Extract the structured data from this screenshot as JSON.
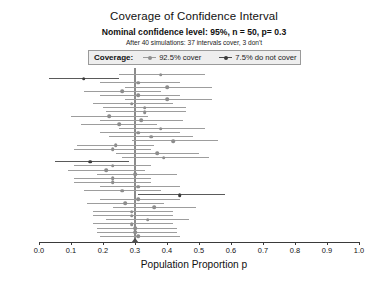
{
  "title": "Coverage of Confidence Interval",
  "subtitle": "Nominal confidence level: 95%, n = 50, p= 0.3",
  "subsubtitle": "After 40 simulations: 37 intervals cover, 3 don't",
  "legend": {
    "title": "Coverage:",
    "entries": [
      {
        "label": "92.5% cover",
        "marker": "cover",
        "color": "#9b9b9b"
      },
      {
        "label": "7.5% do not cover",
        "marker": "nocover",
        "color": "#4a4a4a"
      }
    ]
  },
  "chart_data": {
    "type": "line",
    "title": "Coverage of Confidence Interval",
    "subtitle": "Nominal confidence level: 95%, n = 50, p= 0.3",
    "annotation": "After 40 simulations: 37 intervals cover, 3 don't",
    "xlabel": "Population Proportion p",
    "ylabel": "",
    "xlim": [
      0.0,
      1.0
    ],
    "xticks": [
      0.0,
      0.1,
      0.2,
      0.3,
      0.4,
      0.5,
      0.6,
      0.7,
      0.8,
      0.9,
      1.0
    ],
    "xtick_labels": [
      "0.0",
      "0.1",
      "0.2",
      "0.3",
      "0.4",
      "0.5",
      "0.6",
      "0.7",
      "0.8",
      "0.9",
      "1.0"
    ],
    "grid": false,
    "legend_position": "top",
    "reference_line": {
      "value": 0.3,
      "label": "p = 0.3",
      "color": "#8c8c8c"
    },
    "n": 50,
    "nominal_level": 0.95,
    "n_simulations": 40,
    "n_cover": 37,
    "n_not_cover": 3,
    "pct_cover": "92.5%",
    "pct_not_cover": "7.5%",
    "series": [
      {
        "name": "92.5% cover",
        "color": "#9b9b9b"
      },
      {
        "name": "7.5% do not cover",
        "color": "#4a4a4a"
      }
    ],
    "intervals": [
      {
        "row": 1,
        "estimate": 0.38,
        "lower": 0.25,
        "upper": 0.52,
        "covers": true
      },
      {
        "row": 2,
        "estimate": 0.14,
        "lower": 0.03,
        "upper": 0.25,
        "covers": false
      },
      {
        "row": 3,
        "estimate": 0.31,
        "lower": 0.19,
        "upper": 0.44,
        "covers": true
      },
      {
        "row": 4,
        "estimate": 0.4,
        "lower": 0.27,
        "upper": 0.54,
        "covers": true
      },
      {
        "row": 5,
        "estimate": 0.26,
        "lower": 0.14,
        "upper": 0.38,
        "covers": true
      },
      {
        "row": 6,
        "estimate": 0.31,
        "lower": 0.19,
        "upper": 0.44,
        "covers": true
      },
      {
        "row": 7,
        "estimate": 0.4,
        "lower": 0.27,
        "upper": 0.54,
        "covers": true
      },
      {
        "row": 8,
        "estimate": 0.29,
        "lower": 0.17,
        "upper": 0.42,
        "covers": true
      },
      {
        "row": 9,
        "estimate": 0.33,
        "lower": 0.2,
        "upper": 0.46,
        "covers": true
      },
      {
        "row": 10,
        "estimate": 0.33,
        "lower": 0.21,
        "upper": 0.46,
        "covers": true
      },
      {
        "row": 11,
        "estimate": 0.22,
        "lower": 0.1,
        "upper": 0.34,
        "covers": true
      },
      {
        "row": 12,
        "estimate": 0.32,
        "lower": 0.19,
        "upper": 0.45,
        "covers": true
      },
      {
        "row": 13,
        "estimate": 0.25,
        "lower": 0.13,
        "upper": 0.37,
        "covers": true
      },
      {
        "row": 14,
        "estimate": 0.38,
        "lower": 0.25,
        "upper": 0.52,
        "covers": true
      },
      {
        "row": 15,
        "estimate": 0.31,
        "lower": 0.19,
        "upper": 0.44,
        "covers": true
      },
      {
        "row": 16,
        "estimate": 0.35,
        "lower": 0.22,
        "upper": 0.48,
        "covers": true
      },
      {
        "row": 17,
        "estimate": 0.42,
        "lower": 0.29,
        "upper": 0.56,
        "covers": true
      },
      {
        "row": 18,
        "estimate": 0.24,
        "lower": 0.12,
        "upper": 0.36,
        "covers": true
      },
      {
        "row": 19,
        "estimate": 0.23,
        "lower": 0.11,
        "upper": 0.35,
        "covers": true
      },
      {
        "row": 20,
        "estimate": 0.37,
        "lower": 0.24,
        "upper": 0.5,
        "covers": true
      },
      {
        "row": 21,
        "estimate": 0.39,
        "lower": 0.26,
        "upper": 0.53,
        "covers": true
      },
      {
        "row": 22,
        "estimate": 0.16,
        "lower": 0.05,
        "upper": 0.28,
        "covers": false
      },
      {
        "row": 23,
        "estimate": 0.23,
        "lower": 0.11,
        "upper": 0.35,
        "covers": true
      },
      {
        "row": 24,
        "estimate": 0.21,
        "lower": 0.09,
        "upper": 0.33,
        "covers": true
      },
      {
        "row": 25,
        "estimate": 0.3,
        "lower": 0.18,
        "upper": 0.43,
        "covers": true
      },
      {
        "row": 26,
        "estimate": 0.23,
        "lower": 0.11,
        "upper": 0.35,
        "covers": true
      },
      {
        "row": 27,
        "estimate": 0.23,
        "lower": 0.11,
        "upper": 0.35,
        "covers": true
      },
      {
        "row": 28,
        "estimate": 0.31,
        "lower": 0.19,
        "upper": 0.44,
        "covers": true
      },
      {
        "row": 29,
        "estimate": 0.26,
        "lower": 0.14,
        "upper": 0.38,
        "covers": true
      },
      {
        "row": 30,
        "estimate": 0.44,
        "lower": 0.31,
        "upper": 0.58,
        "covers": false
      },
      {
        "row": 31,
        "estimate": 0.31,
        "lower": 0.19,
        "upper": 0.44,
        "covers": true
      },
      {
        "row": 32,
        "estimate": 0.27,
        "lower": 0.15,
        "upper": 0.39,
        "covers": true
      },
      {
        "row": 33,
        "estimate": 0.36,
        "lower": 0.23,
        "upper": 0.49,
        "covers": true
      },
      {
        "row": 34,
        "estimate": 0.29,
        "lower": 0.17,
        "upper": 0.42,
        "covers": true
      },
      {
        "row": 35,
        "estimate": 0.29,
        "lower": 0.17,
        "upper": 0.42,
        "covers": true
      },
      {
        "row": 36,
        "estimate": 0.34,
        "lower": 0.21,
        "upper": 0.47,
        "covers": true
      },
      {
        "row": 37,
        "estimate": 0.29,
        "lower": 0.17,
        "upper": 0.42,
        "covers": true
      },
      {
        "row": 38,
        "estimate": 0.3,
        "lower": 0.18,
        "upper": 0.43,
        "covers": true
      },
      {
        "row": 39,
        "estimate": 0.3,
        "lower": 0.18,
        "upper": 0.43,
        "covers": true
      },
      {
        "row": 40,
        "estimate": 0.31,
        "lower": 0.19,
        "upper": 0.44,
        "covers": true
      }
    ]
  }
}
